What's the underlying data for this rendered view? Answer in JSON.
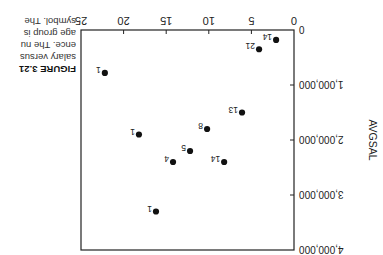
{
  "figure": {
    "label": "FIGURE 3.21",
    "caption_lines": [
      "salary versus",
      "ence. The nu",
      "age group is",
      "symbol. The"
    ],
    "orientation": "rotated 180 degrees"
  },
  "chart_data": {
    "type": "scatter",
    "title": "",
    "xlabel": "",
    "ylabel": "AVGSAL",
    "xlim": [
      0,
      25
    ],
    "ylim": [
      0,
      4000000
    ],
    "x_ticks": [
      0,
      5,
      10,
      15,
      20,
      25
    ],
    "x_tick_labels": [
      "0",
      "5",
      "10",
      "15",
      "20",
      "25"
    ],
    "y_ticks": [
      0,
      1000000,
      2000000,
      3000000,
      4000000
    ],
    "y_tick_labels": [
      "0",
      "1,000,000",
      "2,000,000",
      "3,000,000",
      "4,000,000"
    ],
    "grid": false,
    "legend": null,
    "points": [
      {
        "x": 2.1,
        "y": 180000,
        "label": "14"
      },
      {
        "x": 4.1,
        "y": 350000,
        "label": "21"
      },
      {
        "x": 22.2,
        "y": 780000,
        "label": "1"
      },
      {
        "x": 6.1,
        "y": 1500000,
        "label": "13"
      },
      {
        "x": 10.2,
        "y": 1800000,
        "label": "8"
      },
      {
        "x": 18.2,
        "y": 1900000,
        "label": "1"
      },
      {
        "x": 12.2,
        "y": 2200000,
        "label": "5"
      },
      {
        "x": 14.2,
        "y": 2400000,
        "label": "4"
      },
      {
        "x": 8.2,
        "y": 2400000,
        "label": "14"
      },
      {
        "x": 16.2,
        "y": 3300000,
        "label": "1"
      }
    ]
  }
}
